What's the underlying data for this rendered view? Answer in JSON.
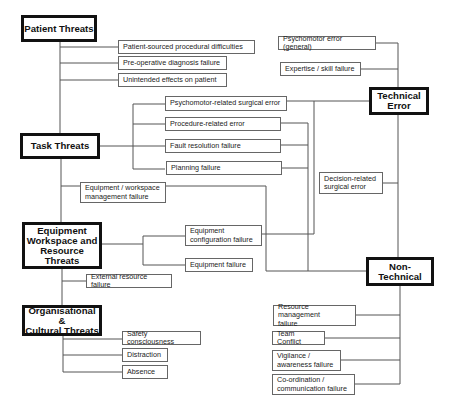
{
  "diagram": {
    "categories": {
      "patient_threats": "Patient Threats",
      "task_threats": "Task Threats",
      "equipment_threats": "Equipment\nWorkspace and\nResource\nThreats",
      "organisational_threats": "Organisational &\nCultural Threats",
      "technical_error": "Technical\nError",
      "non_technical": "Non-\nTechnical"
    },
    "patient_items": [
      "Patient-sourced procedural difficulties",
      "Pre-operative diagnosis failure",
      "Unintended effects on patient"
    ],
    "task_items": [
      "Psychomotor-related surgical error",
      "Procedure-related error",
      "Fault resolution failure",
      "Planning failure"
    ],
    "equipment_items": {
      "workspace_mgmt": "Equipment / workspace\nmanagement failure",
      "config_failure": "Equipment\nconfiguration failure",
      "equipment_failure": "Equipment failure",
      "external_resource": "External resource failure"
    },
    "organisational_items": [
      "Safety consciousness",
      "Distraction",
      "Absence"
    ],
    "technical_items": [
      "Psychomotor error (general)",
      "Expertise / skill failure",
      "Decision-related\nsurgical error"
    ],
    "non_technical_items": [
      "Resource management\nfailure",
      "Team Conflict",
      "Vigilance /\nawareness failure",
      "Co-ordination /\ncommunication failure"
    ]
  }
}
